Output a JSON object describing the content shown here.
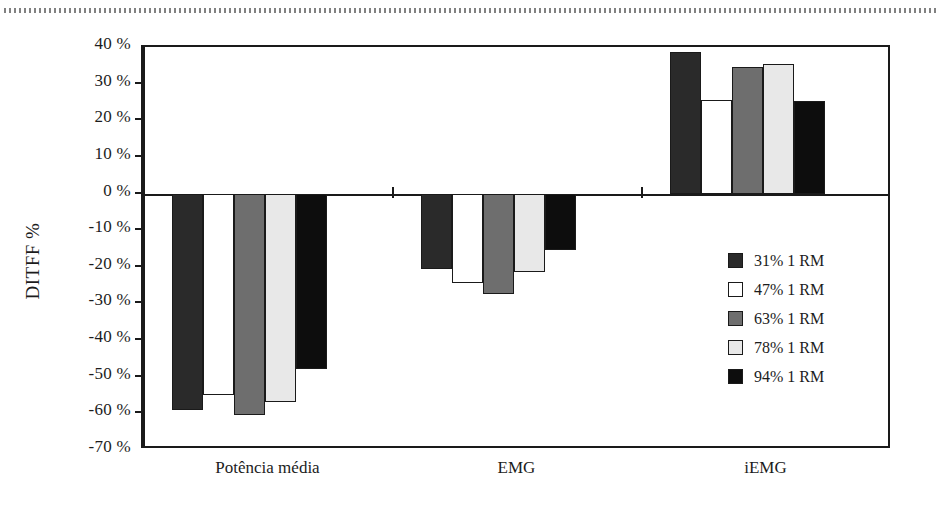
{
  "chart_data": {
    "type": "bar",
    "title": "",
    "subtitle": "",
    "xlabel": "",
    "ylabel": "DITFF %",
    "categories": [
      "Potência média",
      "EMG",
      "iEMG"
    ],
    "series": [
      {
        "name": "31% 1 RM",
        "color": "#2a2a2a",
        "values": [
          -59.0,
          -20.5,
          38.5
        ]
      },
      {
        "name": "47% 1 RM",
        "color": "#ffffff",
        "values": [
          -55.0,
          -24.5,
          25.5
        ]
      },
      {
        "name": "63% 1 RM",
        "color": "#6e6e6e",
        "values": [
          -60.5,
          -27.5,
          34.5
        ]
      },
      {
        "name": "78% 1 RM",
        "color": "#e8e8e8",
        "values": [
          -57.0,
          -21.5,
          35.3
        ]
      },
      {
        "name": "94% 1 RM",
        "color": "#0d0d0d",
        "values": [
          -48.0,
          -15.5,
          25.3
        ]
      }
    ],
    "ylim": [
      -70,
      40
    ],
    "ytick_step": 10,
    "ytick_labels": [
      "40 %",
      "30 %",
      "20 %",
      "10 %",
      "0 %",
      "-10 %",
      "-20 %",
      "-30 %",
      "-40 %",
      "-50 %",
      "-60 %",
      "-70 %"
    ],
    "ytick_values": [
      40,
      30,
      20,
      10,
      0,
      -10,
      -20,
      -30,
      -40,
      -50,
      -60,
      -70
    ],
    "grid": false,
    "legend_position": "inside-right",
    "zero_baseline": true
  },
  "legend": {
    "items": [
      {
        "label": "31% 1 RM",
        "color": "#2a2a2a"
      },
      {
        "label": "47% 1 RM",
        "color": "#ffffff"
      },
      {
        "label": "63% 1 RM",
        "color": "#6e6e6e"
      },
      {
        "label": "78% 1 RM",
        "color": "#e8e8e8"
      },
      {
        "label": "94% 1 RM",
        "color": "#0d0d0d"
      }
    ]
  }
}
